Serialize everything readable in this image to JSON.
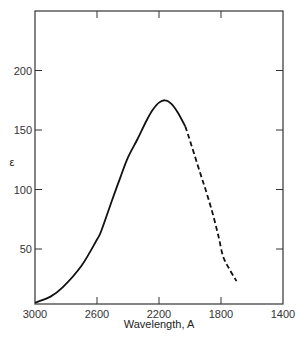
{
  "chart_data": {
    "type": "line",
    "title": "",
    "xlabel": "Wavelength, A",
    "ylabel": "ε",
    "xlim": [
      3000,
      1400
    ],
    "ylim": [
      4,
      206
    ],
    "x_reversed": true,
    "grid": false,
    "legend": null,
    "xticks": [
      3000,
      2600,
      2200,
      1800,
      1400
    ],
    "yticks": [
      50,
      100,
      150,
      200
    ],
    "series": [
      {
        "name": "measured",
        "style": "solid",
        "color": "#111111",
        "x": [
          3000,
          2900,
          2820,
          2700,
          2600,
          2570,
          2500,
          2450,
          2400,
          2340,
          2280,
          2240,
          2200,
          2160,
          2120,
          2080,
          2030
        ],
        "y": [
          5,
          10,
          18,
          36,
          58,
          66,
          92,
          110,
          127,
          142,
          158,
          167,
          173,
          175,
          172,
          165,
          153
        ]
      },
      {
        "name": "extrapolated",
        "style": "dashed",
        "color": "#111111",
        "x": [
          2030,
          1990,
          1935,
          1890,
          1850,
          1815,
          1787,
          1750,
          1700
        ],
        "y": [
          153,
          137,
          114,
          96,
          78,
          60,
          44,
          34,
          23
        ]
      }
    ]
  }
}
